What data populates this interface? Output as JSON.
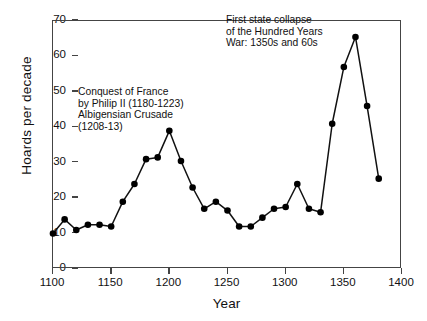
{
  "chart_data": {
    "type": "line",
    "title": "",
    "xlabel": "Year",
    "ylabel": "Hoards per decade",
    "xlim": [
      1100,
      1400
    ],
    "ylim": [
      0,
      70
    ],
    "xticks": [
      1100,
      1150,
      1200,
      1250,
      1300,
      1350,
      1400
    ],
    "yticks": [
      0,
      10,
      20,
      30,
      40,
      50,
      60,
      70
    ],
    "grid": false,
    "legend": null,
    "marker": "filled-circle",
    "x": [
      1100,
      1110,
      1120,
      1130,
      1140,
      1150,
      1160,
      1170,
      1180,
      1190,
      1200,
      1210,
      1220,
      1230,
      1240,
      1250,
      1260,
      1270,
      1280,
      1290,
      1300,
      1310,
      1320,
      1330,
      1340,
      1350,
      1360,
      1370,
      1380
    ],
    "values": [
      10,
      14,
      11,
      12.5,
      12.5,
      12,
      19,
      24,
      31,
      31.5,
      39,
      30.5,
      23,
      17,
      19,
      16.5,
      12,
      12,
      14.5,
      17,
      17.5,
      24,
      17,
      16,
      41,
      57,
      65.5,
      46,
      25.5
    ],
    "annotations": [
      {
        "name": "conquest-of-france",
        "lines": [
          "Conquest of France",
          "by Philip II (1180-1223)",
          "Albigensian Crusade",
          "(1208-13)"
        ]
      },
      {
        "name": "hundred-years-war",
        "lines": [
          "First state collapse",
          "of the Hundred Years",
          "War: 1350s and 60s"
        ]
      }
    ]
  },
  "axes": {
    "y_title": "Hoards per decade",
    "x_title": "Year",
    "y_tick_labels": [
      "0",
      "10",
      "20",
      "30",
      "40",
      "50",
      "60",
      "70"
    ],
    "x_tick_labels": [
      "1100",
      "1150",
      "1200",
      "1250",
      "1300",
      "1350",
      "1400"
    ]
  },
  "colors": {
    "line": "#111111",
    "marker": "#000000",
    "axis": "#444444",
    "text": "#111111",
    "background": "#ffffff"
  }
}
